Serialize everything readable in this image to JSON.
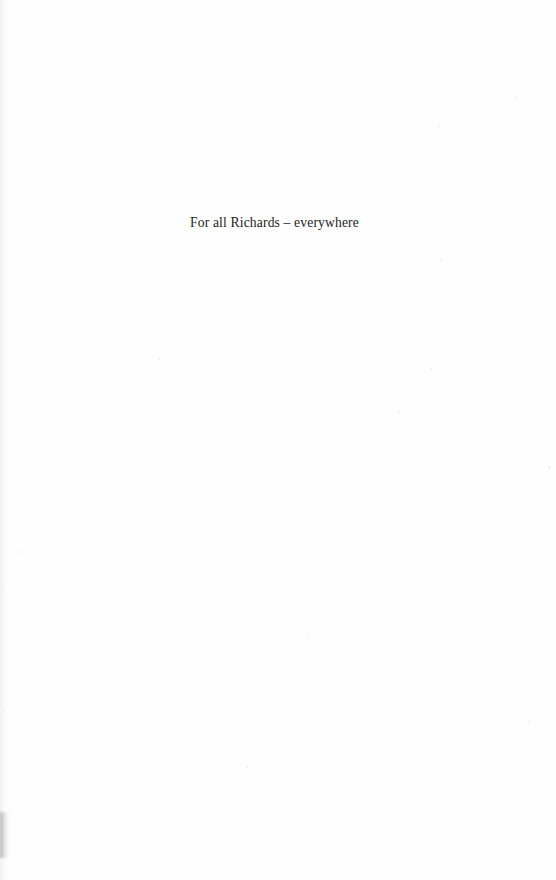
{
  "page": {
    "kind": "book-dedication-page",
    "background_color": "#fefefe",
    "text_color": "#1c1c1c",
    "width": 556,
    "height": 880
  },
  "dedication": {
    "text": "For all Richards – everywhere"
  },
  "artifacts": {
    "gutter_shadow_color": "#d2d2d2",
    "smudge_color": "#787878",
    "flecks": [
      {
        "x": 455,
        "y": 36,
        "size": 2
      },
      {
        "x": 438,
        "y": 125,
        "size": 2
      },
      {
        "x": 515,
        "y": 96,
        "size": 2
      },
      {
        "x": 440,
        "y": 259,
        "size": 2
      },
      {
        "x": 158,
        "y": 358,
        "size": 2
      },
      {
        "x": 430,
        "y": 368,
        "size": 2
      },
      {
        "x": 398,
        "y": 411,
        "size": 2
      },
      {
        "x": 548,
        "y": 466,
        "size": 3
      },
      {
        "x": 18,
        "y": 551,
        "size": 2
      },
      {
        "x": 2,
        "y": 586,
        "size": 2
      },
      {
        "x": 308,
        "y": 637,
        "size": 2
      },
      {
        "x": 487,
        "y": 668,
        "size": 2
      },
      {
        "x": 3,
        "y": 709,
        "size": 2
      },
      {
        "x": 528,
        "y": 721,
        "size": 2
      },
      {
        "x": 246,
        "y": 766,
        "size": 2
      }
    ]
  }
}
